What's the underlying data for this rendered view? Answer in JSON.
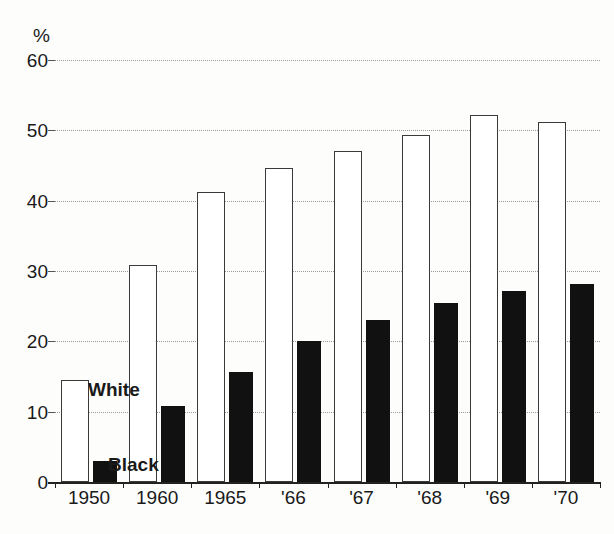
{
  "chart_data": {
    "type": "bar",
    "title": "",
    "subtitle": "",
    "xlabel": "",
    "ylabel": "%",
    "unit_label": "%",
    "categories": [
      "1950",
      "1960",
      "1965",
      "'66",
      "'67",
      "'68",
      "'69",
      "'70"
    ],
    "series": [
      {
        "name": "White",
        "color": "#ffffff",
        "edge_color": "#3a3a3a",
        "values": [
          14.5,
          30.8,
          41.3,
          44.7,
          47.0,
          49.3,
          52.2,
          51.2
        ]
      },
      {
        "name": "Black",
        "color": "#111111",
        "edge_color": "#111111",
        "values": [
          3.0,
          10.8,
          15.7,
          20.1,
          23.1,
          25.5,
          27.1,
          28.1
        ]
      }
    ],
    "ylim": [
      0,
      60
    ],
    "yticks": [
      0,
      10,
      20,
      30,
      40,
      50,
      60
    ],
    "ytick_labels": [
      "0",
      "10",
      "20",
      "30",
      "40",
      "50",
      "60"
    ],
    "grid": true,
    "grid_style": "dotted",
    "legend": "inline-annotations",
    "legend_labels": [
      "White",
      "Black"
    ],
    "annotations": [
      {
        "text": "White",
        "series": "White"
      },
      {
        "text": "Black",
        "series": "Black"
      }
    ]
  }
}
